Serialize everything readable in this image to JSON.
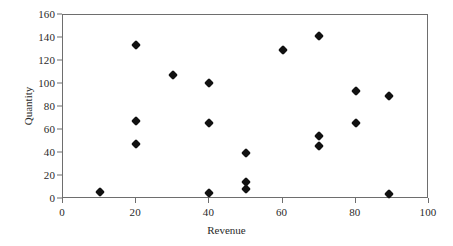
{
  "chart_data": {
    "type": "scatter",
    "title": "",
    "xlabel": "Revenue",
    "ylabel": "Quantity",
    "xlim": [
      0,
      100
    ],
    "ylim": [
      0,
      160
    ],
    "xticks": [
      0,
      20,
      40,
      60,
      80,
      100
    ],
    "yticks": [
      0,
      20,
      40,
      60,
      80,
      100,
      120,
      140,
      160
    ],
    "grid": false,
    "legend": null,
    "marker": "diamond",
    "marker_color": "#111111",
    "frame_color": "#6e6e6e",
    "series": [
      {
        "name": "Quantity vs Revenue",
        "points": [
          {
            "x": 10,
            "y": 6
          },
          {
            "x": 20,
            "y": 134
          },
          {
            "x": 20,
            "y": 68
          },
          {
            "x": 20,
            "y": 48
          },
          {
            "x": 30,
            "y": 108
          },
          {
            "x": 40,
            "y": 101
          },
          {
            "x": 40,
            "y": 66
          },
          {
            "x": 40,
            "y": 5
          },
          {
            "x": 50,
            "y": 40
          },
          {
            "x": 50,
            "y": 15
          },
          {
            "x": 50,
            "y": 9
          },
          {
            "x": 60,
            "y": 130
          },
          {
            "x": 70,
            "y": 142
          },
          {
            "x": 70,
            "y": 55
          },
          {
            "x": 70,
            "y": 46
          },
          {
            "x": 80,
            "y": 94
          },
          {
            "x": 80,
            "y": 66
          },
          {
            "x": 89,
            "y": 90
          },
          {
            "x": 89,
            "y": 4
          }
        ]
      }
    ]
  }
}
